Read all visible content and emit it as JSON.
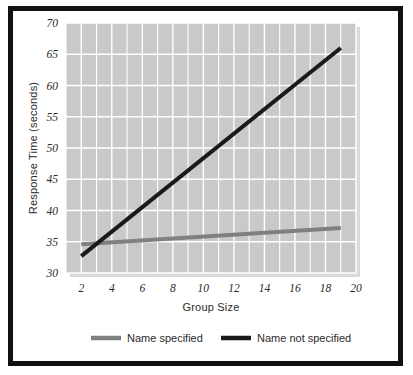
{
  "figure": {
    "background_color": "#ffffff",
    "frame_color": "#111111",
    "plot_background_color": "#c9c9c9",
    "gridline_color": "#ffffff",
    "shadow_color": "#d9d9d9"
  },
  "chart_data": {
    "type": "line",
    "title": "",
    "xlabel": "Group Size",
    "ylabel": "Response Time (seconds)",
    "xlim": [
      1,
      20
    ],
    "ylim": [
      30,
      70
    ],
    "xticks": [
      2,
      4,
      6,
      8,
      10,
      12,
      14,
      16,
      18,
      20
    ],
    "yticks": [
      30,
      35,
      40,
      45,
      50,
      55,
      60,
      65,
      70
    ],
    "xtick_labels": [
      "2",
      "4",
      "6",
      "8",
      "10",
      "12",
      "14",
      "16",
      "18",
      "20"
    ],
    "ytick_labels": [
      "30",
      "35",
      "40",
      "45",
      "50",
      "55",
      "60",
      "65",
      "70"
    ],
    "grid": true,
    "grid_axis": "both",
    "legend_position": "below",
    "x": [
      2,
      19
    ],
    "series": [
      {
        "name": "Name specified",
        "color": "#808080",
        "values": [
          34.6,
          37.2
        ],
        "line_width": 4
      },
      {
        "name": "Name not specified",
        "color": "#1a1a1a",
        "values": [
          32.7,
          66.0
        ],
        "line_width": 4
      }
    ]
  },
  "legend": {
    "items": [
      {
        "label": "Name specified",
        "color": "#808080"
      },
      {
        "label": "Name not specified",
        "color": "#1a1a1a"
      }
    ]
  }
}
